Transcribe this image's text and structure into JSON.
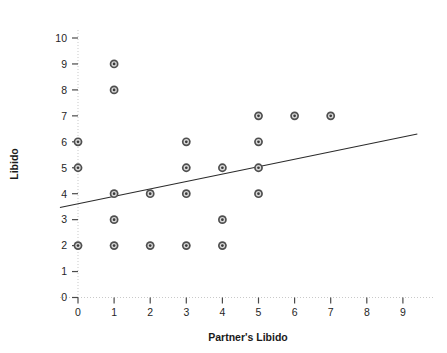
{
  "chart_data": {
    "type": "scatter",
    "title": "",
    "xlabel": "Partner's Libido",
    "ylabel": "Libido",
    "xlim": [
      -0.5,
      9.5
    ],
    "ylim": [
      0,
      10.4
    ],
    "xticks": [
      0,
      1,
      2,
      3,
      4,
      5,
      6,
      7,
      8,
      9
    ],
    "xtick_labels": [
      "0",
      "1",
      "2",
      "3",
      "4",
      "5",
      "6",
      "7",
      "8",
      "9"
    ],
    "yticks": [
      0,
      1,
      2,
      3,
      4,
      5,
      6,
      7,
      8,
      9,
      10
    ],
    "ytick_labels": [
      "0",
      "1",
      "2",
      "3",
      "4",
      "5",
      "6",
      "7",
      "8",
      "9",
      "10"
    ],
    "grid": false,
    "legend": "none",
    "marker": "circle-bullseye",
    "marker_color": "#4f4f4f",
    "points": [
      {
        "x": 0,
        "y": 6
      },
      {
        "x": 0,
        "y": 5
      },
      {
        "x": 0,
        "y": 2
      },
      {
        "x": 1,
        "y": 9
      },
      {
        "x": 1,
        "y": 8
      },
      {
        "x": 1,
        "y": 4
      },
      {
        "x": 1,
        "y": 3
      },
      {
        "x": 1,
        "y": 2
      },
      {
        "x": 2,
        "y": 4
      },
      {
        "x": 2,
        "y": 2
      },
      {
        "x": 3,
        "y": 6
      },
      {
        "x": 3,
        "y": 5
      },
      {
        "x": 3,
        "y": 4
      },
      {
        "x": 3,
        "y": 2
      },
      {
        "x": 4,
        "y": 5
      },
      {
        "x": 4,
        "y": 3
      },
      {
        "x": 4,
        "y": 2
      },
      {
        "x": 5,
        "y": 7
      },
      {
        "x": 5,
        "y": 6
      },
      {
        "x": 5,
        "y": 5
      },
      {
        "x": 5,
        "y": 4
      },
      {
        "x": 6,
        "y": 7
      },
      {
        "x": 7,
        "y": 7
      }
    ],
    "fit_line": {
      "type": "linear-regression",
      "x_start": -0.5,
      "y_start": 3.47,
      "x_end": 9.4,
      "y_end": 6.3,
      "color": "#2b2b2b"
    }
  }
}
